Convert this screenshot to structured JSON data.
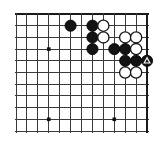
{
  "diagram": {
    "kind": "go-board-diagram",
    "board": {
      "columns": 13,
      "rows": 11,
      "left": 16,
      "top": 14,
      "col_spacing": 10.92,
      "row_spacing": 11.7,
      "line_color": "#3a3a3a",
      "border_color": "#1a1a1a",
      "background_color": "#ffffff",
      "edges": {
        "top": true,
        "right": true,
        "bottom": false,
        "left": false
      }
    },
    "star_points": [
      {
        "col": 3,
        "row": 3
      },
      {
        "col": 3,
        "row": 9
      },
      {
        "col": 9,
        "row": 9
      }
    ],
    "stones": [
      {
        "color": "black",
        "col": 5,
        "row": 1,
        "mark": "none"
      },
      {
        "color": "black",
        "col": 7,
        "row": 1,
        "mark": "none"
      },
      {
        "color": "white",
        "col": 8,
        "row": 1,
        "mark": "none"
      },
      {
        "color": "black",
        "col": 7,
        "row": 2,
        "mark": "none"
      },
      {
        "color": "white",
        "col": 8,
        "row": 2,
        "mark": "none"
      },
      {
        "color": "white",
        "col": 10,
        "row": 2,
        "mark": "none"
      },
      {
        "color": "white",
        "col": 11,
        "row": 2,
        "mark": "none"
      },
      {
        "color": "black",
        "col": 7,
        "row": 3,
        "mark": "none"
      },
      {
        "color": "black",
        "col": 9,
        "row": 3,
        "mark": "none"
      },
      {
        "color": "black",
        "col": 10,
        "row": 3,
        "mark": "none"
      },
      {
        "color": "white",
        "col": 11,
        "row": 3,
        "mark": "none"
      },
      {
        "color": "black",
        "col": 10,
        "row": 4,
        "mark": "none"
      },
      {
        "color": "black",
        "col": 11,
        "row": 4,
        "mark": "none"
      },
      {
        "color": "black",
        "col": 12,
        "row": 4,
        "mark": "triangle"
      },
      {
        "color": "white",
        "col": 10,
        "row": 5,
        "mark": "none"
      },
      {
        "color": "white",
        "col": 11,
        "row": 5,
        "mark": "none"
      }
    ],
    "stone_radius": 5.6,
    "marker": {
      "type": "triangle",
      "color": "#ffffff",
      "size": 6
    }
  }
}
